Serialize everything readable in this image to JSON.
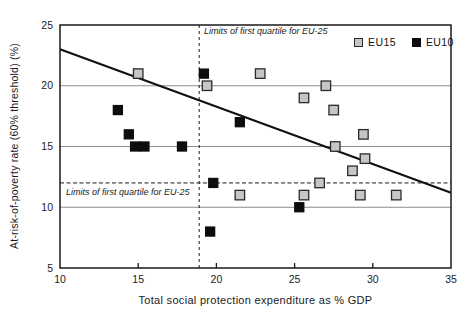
{
  "chart_data": {
    "type": "scatter",
    "title": "",
    "xlabel": "Total social protection expenditure as % GDP",
    "ylabel": "At-risk-of-poverty rate (60% threshold) (%)",
    "xlim": [
      10,
      35
    ],
    "ylim": [
      5,
      25
    ],
    "x_ticks": [
      "10",
      "15",
      "20",
      "25",
      "30",
      "35"
    ],
    "y_ticks": [
      "5",
      "10",
      "15",
      "20",
      "25"
    ],
    "gridlines_y": [
      10,
      15,
      20
    ],
    "grid": "horizontal-only",
    "legend_position": "top-right-inside",
    "colors": {
      "eu15_fill": "#c6c6c6",
      "eu15_border": "#2b2b2b",
      "eu10_fill": "#0d0d0d",
      "axis": "#1a1a1a",
      "gridline": "#8c8c8c",
      "trend": "#111111"
    },
    "series": [
      {
        "name": "EU15",
        "marker": "square",
        "fill": "#c6c6c6",
        "stroke": "#2b2b2b",
        "points": [
          [
            15.0,
            21
          ],
          [
            19.4,
            20
          ],
          [
            22.8,
            21
          ],
          [
            27.0,
            20
          ],
          [
            25.6,
            19
          ],
          [
            27.5,
            18
          ],
          [
            29.4,
            16
          ],
          [
            27.6,
            15
          ],
          [
            29.5,
            14
          ],
          [
            28.7,
            13
          ],
          [
            26.6,
            12
          ],
          [
            21.5,
            11
          ],
          [
            25.6,
            11
          ],
          [
            29.2,
            11
          ],
          [
            31.5,
            11
          ]
        ]
      },
      {
        "name": "EU10",
        "marker": "square",
        "fill": "#0d0d0d",
        "stroke": "#0d0d0d",
        "points": [
          [
            13.7,
            18
          ],
          [
            14.4,
            16
          ],
          [
            14.8,
            15
          ],
          [
            15.4,
            15
          ],
          [
            17.8,
            15
          ],
          [
            19.2,
            21
          ],
          [
            21.5,
            17
          ],
          [
            19.8,
            12
          ],
          [
            19.6,
            8
          ],
          [
            25.3,
            10
          ]
        ]
      }
    ],
    "trend_line": {
      "x1": 10,
      "y1": 23.0,
      "x2": 35,
      "y2": 11.2
    },
    "quartile_limit_vertical": {
      "x": 18.9,
      "label": "Limits of first quartile for EU-25"
    },
    "quartile_limit_horizontal": {
      "y": 12.0,
      "label": "Limits of first quartile for EU-25"
    }
  }
}
